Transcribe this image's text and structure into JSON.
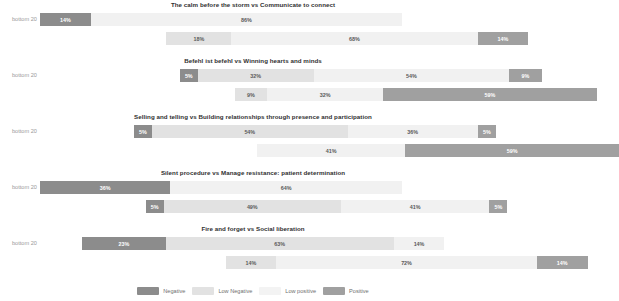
{
  "axis": {
    "left_label": "bottom 20",
    "right_label": "top 20"
  },
  "legend": {
    "items": [
      {
        "key": "neg",
        "label": "Negative",
        "color": "#8c8c8c"
      },
      {
        "key": "lowneg",
        "label": "Low Negative",
        "color": "#e2e2e2"
      },
      {
        "key": "lowpos",
        "label": "Low positive",
        "color": "#f3f3f3"
      },
      {
        "key": "pos",
        "label": "Positive",
        "color": "#a0a0a0"
      }
    ]
  },
  "chart_data": {
    "type": "bar",
    "subtype": "diverging-stacked-bar",
    "title": "",
    "xlabel": "",
    "ylabel": "",
    "grid": false,
    "legend_position": "bottom",
    "categories": [
      "Negative",
      "Low Negative",
      "Low positive",
      "Positive"
    ],
    "series_colors": [
      "#8c8c8c",
      "#e2e2e2",
      "#f1f1f1",
      "#a0a0a0"
    ],
    "group_labels": [
      "bottom 20",
      "top 20"
    ],
    "panels": [
      {
        "title": "The calm before the storm vs Communicate to connect",
        "rows": [
          {
            "group": "bottom 20",
            "start_pct": 5.8,
            "segments": [
              {
                "key": "neg",
                "label": "14%",
                "value": 14
              },
              {
                "key": "lowpos",
                "label": "86%",
                "value": 86
              }
            ]
          },
          {
            "group": "top 20",
            "start_pct": 32.0,
            "segments": [
              {
                "key": "lowneg",
                "label": "18%",
                "value": 18
              },
              {
                "key": "lowpos",
                "label": "68%",
                "value": 68
              },
              {
                "key": "pos",
                "label": "14%",
                "value": 14
              }
            ]
          }
        ]
      },
      {
        "title": "Befehl ist befehl vs Winning hearts and minds",
        "rows": [
          {
            "group": "bottom 20",
            "start_pct": 34.8,
            "segments": [
              {
                "key": "neg",
                "label": "5%",
                "value": 5
              },
              {
                "key": "lowneg",
                "label": "32%",
                "value": 32
              },
              {
                "key": "lowpos",
                "label": "54%",
                "value": 54
              },
              {
                "key": "pos",
                "label": "9%",
                "value": 9
              }
            ]
          },
          {
            "group": "top 20",
            "start_pct": 46.2,
            "segments": [
              {
                "key": "lowneg",
                "label": "9%",
                "value": 9
              },
              {
                "key": "lowpos",
                "label": "32%",
                "value": 32
              },
              {
                "key": "pos",
                "label": "59%",
                "value": 59
              }
            ]
          }
        ]
      },
      {
        "title": "Selling and telling vs Building relationships through presence and participation",
        "rows": [
          {
            "group": "bottom 20",
            "start_pct": 25.3,
            "segments": [
              {
                "key": "neg",
                "label": "5%",
                "value": 5
              },
              {
                "key": "lowneg",
                "label": "54%",
                "value": 54
              },
              {
                "key": "lowpos",
                "label": "36%",
                "value": 36
              },
              {
                "key": "pos",
                "label": "5%",
                "value": 5
              }
            ]
          },
          {
            "group": "top 20",
            "start_pct": 50.8,
            "segments": [
              {
                "key": "lowpos",
                "label": "41%",
                "value": 41
              },
              {
                "key": "pos",
                "label": "59%",
                "value": 59
              }
            ]
          }
        ]
      },
      {
        "title": "Silent procedure vs Manage resistance: patient determination",
        "rows": [
          {
            "group": "bottom 20",
            "start_pct": 5.8,
            "segments": [
              {
                "key": "neg",
                "label": "36%",
                "value": 36
              },
              {
                "key": "lowpos",
                "label": "64%",
                "value": 64
              }
            ]
          },
          {
            "group": "top 20",
            "start_pct": 27.7,
            "segments": [
              {
                "key": "neg",
                "label": "5%",
                "value": 5
              },
              {
                "key": "lowneg",
                "label": "49%",
                "value": 49
              },
              {
                "key": "lowpos",
                "label": "41%",
                "value": 41
              },
              {
                "key": "pos",
                "label": "5%",
                "value": 5
              }
            ]
          }
        ]
      },
      {
        "title": "Fire and forget vs Social liberation",
        "rows": [
          {
            "group": "bottom 20",
            "start_pct": 14.6,
            "segments": [
              {
                "key": "neg",
                "label": "23%",
                "value": 23
              },
              {
                "key": "lowneg",
                "label": "63%",
                "value": 63
              },
              {
                "key": "lowpos",
                "label": "14%",
                "value": 14
              }
            ]
          },
          {
            "group": "top 20",
            "start_pct": 44.3,
            "segments": [
              {
                "key": "lowneg",
                "label": "14%",
                "value": 14
              },
              {
                "key": "lowpos",
                "label": "72%",
                "value": 72
              },
              {
                "key": "pos",
                "label": "14%",
                "value": 14
              }
            ]
          }
        ]
      }
    ]
  }
}
